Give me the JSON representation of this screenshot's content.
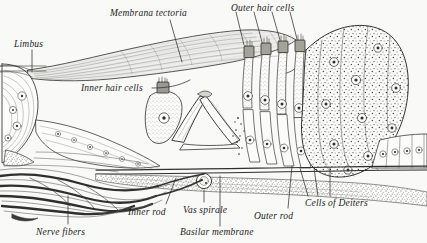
{
  "figure": {
    "medium": "engraving",
    "background_color": "#f9f9f8",
    "ink_color": "#2a2a28",
    "width": 427,
    "height": 243
  },
  "labels": [
    {
      "id": "limbus",
      "text": "Limbus",
      "x": 14,
      "y": 40,
      "leader": true
    },
    {
      "id": "membrana-tectoria",
      "text": "Membrana tectoria",
      "x": 110,
      "y": 9,
      "leader": true
    },
    {
      "id": "outer-hair-cells",
      "text": "Outer hair cells",
      "x": 231,
      "y": 4,
      "leader": true
    },
    {
      "id": "inner-hair-cells",
      "text": "Inner hair cells",
      "x": 81,
      "y": 84,
      "leader": true
    },
    {
      "id": "nerve-fibers",
      "text": "Nerve fibers",
      "x": 36,
      "y": 228,
      "leader": true
    },
    {
      "id": "inner-rod",
      "text": "Inner rod",
      "x": 128,
      "y": 208,
      "leader": true
    },
    {
      "id": "vas-spirale",
      "text": "Vas spirale",
      "x": 183,
      "y": 206,
      "leader": true
    },
    {
      "id": "basilar-membrane",
      "text": "Basilar membrane",
      "x": 180,
      "y": 228,
      "leader": true
    },
    {
      "id": "outer-rod",
      "text": "Outer rod",
      "x": 254,
      "y": 212,
      "leader": true
    },
    {
      "id": "cells-of-deiters",
      "text": "Cells of Deiters",
      "x": 305,
      "y": 199,
      "leader": true
    }
  ],
  "structures": [
    "membrana-tectoria",
    "limbus-spiralis",
    "inner-hair-cell",
    "outer-hair-cells",
    "inner-rod-of-corti",
    "outer-rod-of-corti",
    "tunnel-of-corti",
    "cells-of-deiters",
    "hensen-claudius-cell-mass",
    "basilar-membrane",
    "vas-spirale",
    "nerve-fiber-bundle"
  ]
}
